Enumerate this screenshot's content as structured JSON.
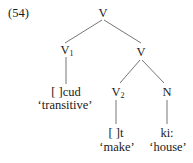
{
  "example_number": "(54)",
  "tree": {
    "root": {
      "label": "V"
    },
    "left": {
      "label": "V",
      "subscript": "1",
      "form": "[    ]cud",
      "gloss": "‘transitive’"
    },
    "right": {
      "label": "V",
      "children": {
        "v2": {
          "label": "V",
          "subscript": "2",
          "form": "[    ]t",
          "gloss": "‘make’"
        },
        "n": {
          "label": "N",
          "form": "ki:",
          "gloss": "‘house’"
        }
      }
    }
  },
  "colors": {
    "line": "#555555",
    "text": "#1a1a1a"
  }
}
